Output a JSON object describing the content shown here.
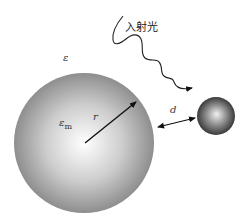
{
  "diagram": {
    "incident_light_label": "入射光",
    "medium_permittivity_label": "ε",
    "sphere_permittivity_label": "ε",
    "sphere_permittivity_subscript": "m",
    "radius_label": "r",
    "distance_label": "d"
  },
  "colors": {
    "sphere_highlight": "#ffffff",
    "sphere_mid": "#c8c8c8",
    "sphere_edge": "#8a8a8a",
    "small_sphere_highlight": "#f0f0f0",
    "small_sphere_edge": "#3a3a3a",
    "arrow": "#111111",
    "background": "#ffffff"
  }
}
